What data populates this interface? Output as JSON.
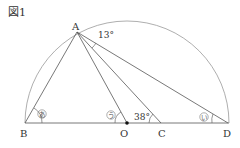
{
  "figure": {
    "title": "図1",
    "points": {
      "A": {
        "label": "A",
        "x": 77,
        "y": 32
      },
      "B": {
        "label": "B",
        "x": 25,
        "y": 123
      },
      "O": {
        "label": "O",
        "x": 127,
        "y": 123
      },
      "C": {
        "label": "C",
        "x": 161,
        "y": 123
      },
      "D": {
        "label": "D",
        "x": 228,
        "y": 123
      }
    },
    "angles": {
      "angle_at_A": "13°",
      "angle_at_C": "38°"
    },
    "markers": {
      "a": "あ",
      "i": "い",
      "u": "う"
    },
    "colors": {
      "line": "#555555",
      "arc": "#888888",
      "text": "#333333"
    }
  }
}
